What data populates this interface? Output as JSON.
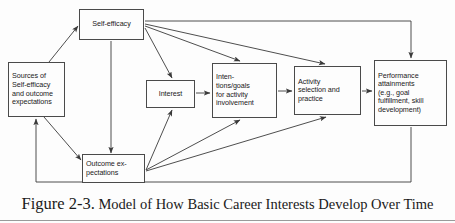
{
  "figure": {
    "caption_lead": "Figure 2-3.",
    "caption_rest": " Model of How Basic Career Interests Develop Over Time",
    "stroke_color": "#4a4a4a",
    "text_color": "#1a1a1a",
    "background_color": "#fdfdfd"
  },
  "diagram": {
    "type": "flow-diagram",
    "nodes": [
      {
        "id": "self-efficacy",
        "label": "Self-efficacy",
        "x": 79,
        "y": 9,
        "w": 65,
        "h": 31,
        "align": "center"
      },
      {
        "id": "sources",
        "label": "Sources of\nSelf-efficacy\nand outcome\nexpectations",
        "x": 8,
        "y": 62,
        "w": 57,
        "h": 55,
        "align": "left"
      },
      {
        "id": "interest",
        "label": "Interest",
        "x": 146,
        "y": 80,
        "w": 49,
        "h": 28,
        "align": "center"
      },
      {
        "id": "intentions",
        "label": "Inten-\ntions/goals\nfor activity\ninvolvement",
        "x": 212,
        "y": 63,
        "w": 65,
        "h": 55,
        "align": "left"
      },
      {
        "id": "activity",
        "label": "Activity\nselection and\npractice",
        "x": 294,
        "y": 66,
        "w": 67,
        "h": 49,
        "align": "left"
      },
      {
        "id": "performance",
        "label": "Performance\nattainments\n(e.g., goal\nfulfillment, skill\ndevelopment)",
        "x": 374,
        "y": 60,
        "w": 73,
        "h": 66,
        "align": "left"
      },
      {
        "id": "outcome-expectations",
        "label": "Outcome ex-\npectations",
        "x": 82,
        "y": 154,
        "w": 63,
        "h": 29,
        "align": "left"
      }
    ],
    "edges": [
      {
        "id": "sources-to-self-efficacy",
        "from": "sources",
        "to": "self-efficacy"
      },
      {
        "id": "sources-to-outcome-expectations",
        "from": "sources",
        "to": "outcome-expectations"
      },
      {
        "id": "self-efficacy-to-outcome-expectations",
        "from": "self-efficacy",
        "to": "outcome-expectations"
      },
      {
        "id": "self-efficacy-to-interest",
        "from": "self-efficacy",
        "to": "interest"
      },
      {
        "id": "self-efficacy-to-intentions",
        "from": "self-efficacy",
        "to": "intentions"
      },
      {
        "id": "self-efficacy-to-activity",
        "from": "self-efficacy",
        "to": "activity"
      },
      {
        "id": "self-efficacy-to-performance",
        "from": "self-efficacy",
        "to": "performance"
      },
      {
        "id": "outcome-expectations-to-interest",
        "from": "outcome-expectations",
        "to": "interest"
      },
      {
        "id": "outcome-expectations-to-intentions",
        "from": "outcome-expectations",
        "to": "intentions"
      },
      {
        "id": "outcome-expectations-to-activity",
        "from": "outcome-expectations",
        "to": "activity"
      },
      {
        "id": "interest-to-intentions",
        "from": "interest",
        "to": "intentions"
      },
      {
        "id": "intentions-to-activity",
        "from": "intentions",
        "to": "activity"
      },
      {
        "id": "activity-to-performance",
        "from": "activity",
        "to": "performance"
      },
      {
        "id": "performance-to-sources-feedback",
        "from": "performance",
        "to": "sources"
      }
    ]
  }
}
